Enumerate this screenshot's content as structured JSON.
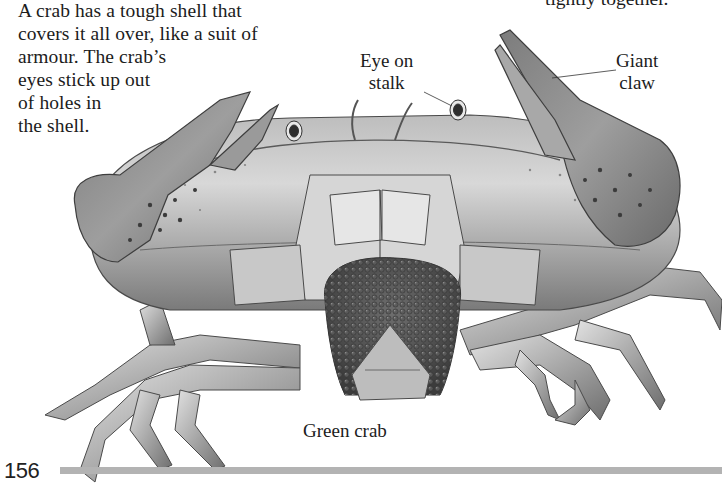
{
  "page": {
    "number": "156",
    "rule_color": "#b3b3b3"
  },
  "body_text": {
    "lines": [
      "A crab has a tough shell that",
      "covers it all over, like a suit of",
      "armour. The crab’s",
      "eyes stick up out",
      "of holes in",
      "the shell."
    ]
  },
  "continued_text": {
    "line": "tightly together."
  },
  "labels": {
    "eye_on_stalk": {
      "line1": "Eye on",
      "line2": "stalk"
    },
    "giant_claw": {
      "line1": "Giant",
      "line2": "claw"
    }
  },
  "caption": "Green crab",
  "illustration": {
    "subject": "crab-illustration",
    "shell_color": "#9a9a9a",
    "highlight_color": "#e6e6e6",
    "shadow_color": "#555555",
    "spot_color": "#4a4a4a"
  }
}
